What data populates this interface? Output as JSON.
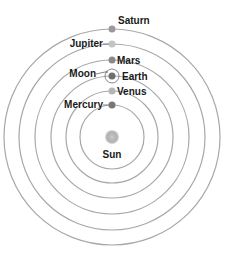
{
  "diagram": {
    "center": {
      "x": 112,
      "y": 137
    },
    "sun": {
      "label": "Sun",
      "color": "#b0b0b0"
    },
    "planets": [
      {
        "name": "Mercury",
        "radius": 32,
        "color": "#777777",
        "label_side": "left"
      },
      {
        "name": "Venus",
        "radius": 46,
        "color": "#b5b5b5",
        "label_side": "right"
      },
      {
        "name": "Earth",
        "radius": 61,
        "color": "#6f6f6f",
        "label_side": "right"
      },
      {
        "name": "Mars",
        "radius": 77,
        "color": "#8a8a8a",
        "label_side": "right"
      },
      {
        "name": "Jupiter",
        "radius": 93,
        "color": "#c4c4c4",
        "label_side": "left"
      },
      {
        "name": "Saturn",
        "radius": 108,
        "color": "#9a9a9a",
        "label_side": "right"
      }
    ],
    "moon": {
      "label": "Moon",
      "orbit_radius": 7
    },
    "orbit_color": "#a8a8a8"
  }
}
